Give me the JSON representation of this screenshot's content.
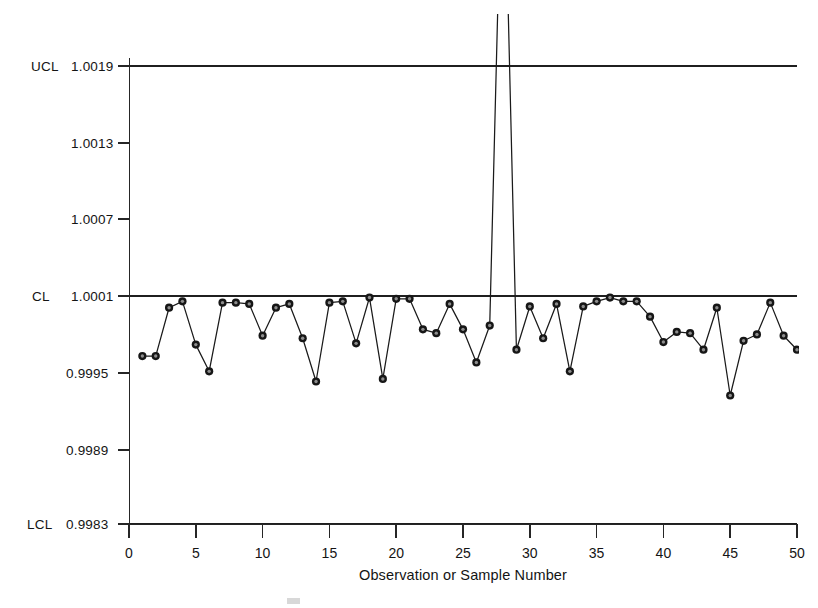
{
  "chart_data": {
    "type": "line",
    "title": "",
    "subtitle": "",
    "xlabel": "Observation or Sample Number",
    "ylabel": "",
    "grid": false,
    "legend_position": "none",
    "xlim": [
      0,
      50
    ],
    "ylim": [
      0.9983,
      1.0019
    ],
    "x": [
      1,
      2,
      3,
      4,
      5,
      6,
      7,
      8,
      9,
      10,
      11,
      12,
      13,
      14,
      15,
      16,
      17,
      18,
      19,
      20,
      21,
      22,
      23,
      24,
      25,
      26,
      27,
      28,
      29,
      30,
      31,
      32,
      33,
      34,
      35,
      36,
      37,
      38,
      39,
      40,
      41,
      42,
      43,
      44,
      45,
      46,
      47,
      48,
      49,
      50
    ],
    "values": [
      0.99962,
      0.99962,
      1.0,
      1.00005,
      0.99971,
      0.9995,
      1.00004,
      1.00004,
      1.00003,
      0.99978,
      1.0,
      1.00003,
      0.99976,
      0.99942,
      1.00004,
      1.00005,
      0.99972,
      1.00008,
      0.99944,
      1.00007,
      1.00007,
      0.99983,
      0.9998,
      1.00003,
      0.99983,
      0.99957,
      0.99986,
      1.004,
      0.99967,
      1.00001,
      0.99976,
      1.00003,
      0.9995,
      1.00001,
      1.00005,
      1.00008,
      1.00005,
      1.00005,
      0.99993,
      0.99973,
      0.99981,
      0.9998,
      0.99967,
      1.0,
      0.99931,
      0.99974,
      0.99979,
      1.00004,
      0.99978,
      0.99967
    ],
    "x_ticks": [
      0,
      5,
      10,
      15,
      20,
      25,
      30,
      35,
      40,
      45,
      50
    ],
    "x_tick_labels": [
      "0",
      "5",
      "10",
      "15",
      "20",
      "25",
      "30",
      "35",
      "40",
      "45",
      "50"
    ],
    "y_ticks": [
      1.0019,
      1.0013,
      1.0007,
      1.0001,
      0.9995,
      0.9989,
      0.9983
    ],
    "y_tick_labels": [
      "1.0019",
      "1.0013",
      "1.0007",
      "1.0001",
      "0.9995",
      "0.9989",
      "0.9983"
    ],
    "y_tick_prefixes": [
      "UCL",
      "",
      "",
      "CL",
      "",
      "",
      "LCL"
    ],
    "control_limits": {
      "ucl_label": "UCL",
      "ucl_value": 1.0019,
      "cl_label": "CL",
      "cl_value": 1.0001,
      "lcl_label": "LCL",
      "lcl_value": 0.9983
    },
    "out_of_control_points": [
      28
    ],
    "marker_style": "circle",
    "line_color": "#1a1a1a",
    "limit_color": "#1f1f1f",
    "note": "Observation 28 exceeds the plot area and is clipped at the top of the chart."
  }
}
